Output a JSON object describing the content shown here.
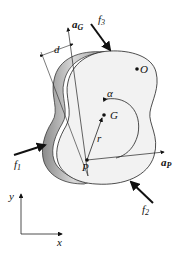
{
  "figure": {
    "type": "rigid-body free-body diagram",
    "labels": {
      "aG": {
        "main": "a",
        "sub": "G"
      },
      "f3": {
        "main": "f",
        "sub": "3"
      },
      "d": "d",
      "O": "O",
      "alpha": "α",
      "G": "G",
      "r": "r",
      "f1": {
        "main": "f",
        "sub": "1"
      },
      "P": "P",
      "aP": {
        "main": "a",
        "sub": "P"
      },
      "f2": {
        "main": "f",
        "sub": "2"
      },
      "y": "y",
      "x": "x"
    },
    "colors": {
      "body_fill": "#f2f2f2",
      "edge_shade": "#b8b8b8",
      "line": "#111111"
    }
  }
}
